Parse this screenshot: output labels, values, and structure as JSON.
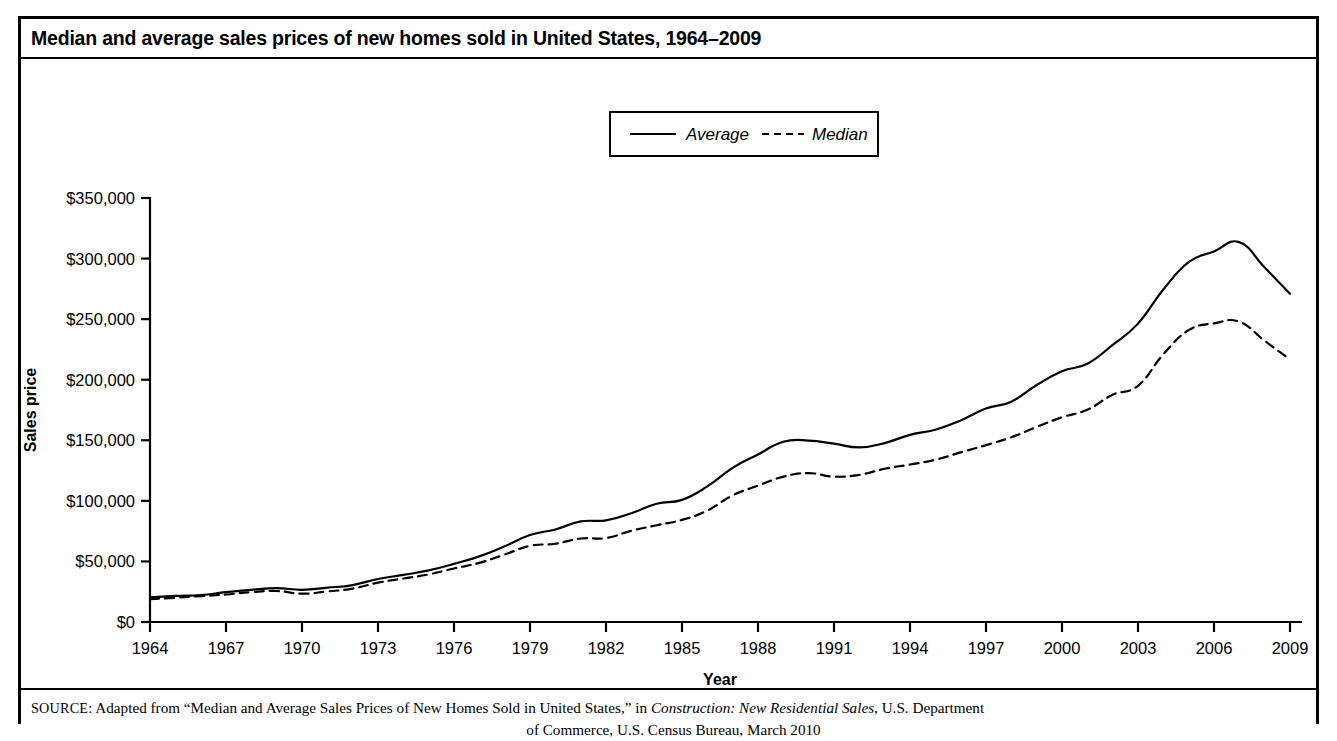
{
  "title": "Median and average sales prices of new homes sold in United States, 1964–2009",
  "source_note": {
    "label": "SOURCE:",
    "text_before_italic": " Adapted from “Median and Average Sales Prices of New Homes Sold in United States,” in ",
    "italic_text": "Construction: New Residential Sales",
    "text_after_italic": ", U.S. Department",
    "line2": "of Commerce, U.S. Census Bureau, March 2010"
  },
  "legend": {
    "position": "top-center",
    "entries": [
      {
        "label": "Average",
        "style": "solid"
      },
      {
        "label": "Median",
        "style": "dashed"
      }
    ]
  },
  "chart_data": {
    "type": "line",
    "title": "Median and average sales prices of new homes sold in United States, 1964–2009",
    "xlabel": "Year",
    "ylabel": "Sales price",
    "xlim": [
      1964,
      2009
    ],
    "ylim": [
      0,
      350000
    ],
    "grid": false,
    "x_tick_labels": [
      "1964",
      "1967",
      "1970",
      "1973",
      "1976",
      "1979",
      "1982",
      "1985",
      "1988",
      "1991",
      "1994",
      "1997",
      "2000",
      "2003",
      "2006",
      "2009"
    ],
    "x_ticks": [
      1964,
      1967,
      1970,
      1973,
      1976,
      1979,
      1982,
      1985,
      1988,
      1991,
      1994,
      1997,
      2000,
      2003,
      2006,
      2009
    ],
    "y_tick_labels": [
      "$0",
      "$50,000",
      "$100,000",
      "$150,000",
      "$200,000",
      "$250,000",
      "$300,000",
      "$350,000"
    ],
    "y_ticks": [
      0,
      50000,
      100000,
      150000,
      200000,
      250000,
      300000,
      350000
    ],
    "x": [
      1964,
      1965,
      1966,
      1967,
      1968,
      1969,
      1970,
      1971,
      1972,
      1973,
      1974,
      1975,
      1976,
      1977,
      1978,
      1979,
      1980,
      1981,
      1982,
      1983,
      1984,
      1985,
      1986,
      1987,
      1988,
      1989,
      1990,
      1991,
      1992,
      1993,
      1994,
      1995,
      1996,
      1997,
      1998,
      1999,
      2000,
      2001,
      2002,
      2003,
      2004,
      2005,
      2006,
      2007,
      2008,
      2009
    ],
    "series": [
      {
        "name": "Average",
        "style": "solid",
        "values": [
          20400,
          21500,
          22300,
          24600,
          26600,
          27900,
          26600,
          28300,
          30500,
          35500,
          38900,
          42600,
          48000,
          54200,
          62500,
          71800,
          76400,
          83000,
          83900,
          89800,
          97600,
          100800,
          111900,
          127200,
          138300,
          148800,
          149800,
          147200,
          144100,
          147700,
          154500,
          158700,
          166400,
          176200,
          181900,
          195600,
          207000,
          213200,
          228700,
          246300,
          274500,
          297000,
          305900,
          313600,
          292600,
          270900
        ]
      },
      {
        "name": "Median",
        "style": "dashed",
        "values": [
          18900,
          20000,
          21400,
          22700,
          24700,
          25600,
          23400,
          25200,
          27600,
          32500,
          35900,
          39300,
          44200,
          48800,
          55700,
          62900,
          64600,
          68900,
          69300,
          75300,
          79900,
          84300,
          92000,
          104500,
          112500,
          120000,
          122900,
          120000,
          121500,
          126500,
          130000,
          133900,
          140000,
          146000,
          152500,
          161000,
          169000,
          175200,
          187600,
          195000,
          221000,
          240900,
          246500,
          247900,
          232100,
          216700
        ]
      }
    ]
  }
}
